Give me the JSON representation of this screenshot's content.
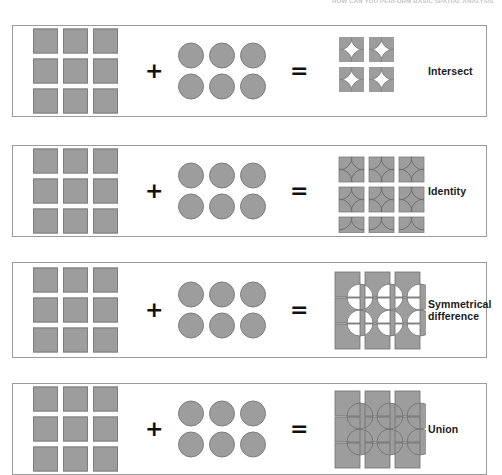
{
  "top_caption": "HOW CAN YOU PERFORM BASIC SPATIAL ANALYSIS",
  "operators": {
    "plus": "+",
    "equals": "="
  },
  "operands": {
    "squares": {
      "rows": 3,
      "cols": 3,
      "count": 9,
      "fill": "#9d9d9d",
      "stroke": "#7d7d7d"
    },
    "circles": {
      "rows": 2,
      "cols": 3,
      "count": 6,
      "fill": "#9d9d9d",
      "stroke": "#7d7d7d"
    }
  },
  "panels": [
    {
      "id": "intersect",
      "label": "Intersect",
      "result_type": "intersection-wedges",
      "description": "Only the overlapping lens areas remain as small wedge fragments"
    },
    {
      "id": "identity",
      "label": "Identity",
      "result_type": "squares-with-circle-arcs",
      "description": "Full square grid retained with faint circle arcs drawn over it"
    },
    {
      "id": "symmetrical-difference",
      "label": "Symmetrical\ndifference",
      "result_type": "symmetric-difference",
      "description": "Squares and circles kept except where they overlap, overlaps knocked out white"
    },
    {
      "id": "union",
      "label": "Union",
      "result_type": "union",
      "description": "Squares and circles merged into one solid combined shape"
    }
  ]
}
